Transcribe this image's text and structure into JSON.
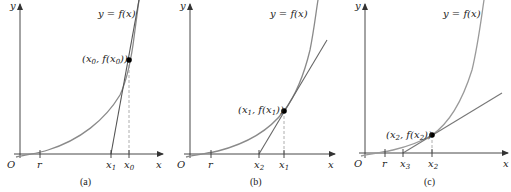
{
  "colors": {
    "axis": "#333333",
    "curve": "#8a8a8a",
    "tangent": "#6e6e6e",
    "point": "#000000",
    "dashed": "#9a9a9a"
  },
  "panels": [
    {
      "caption": "(a)",
      "curve_label": "y = f(x)",
      "point_label_var": "x",
      "point_label_sub": "0",
      "axis_labels": {
        "origin": "O",
        "y": "y",
        "x": "x"
      },
      "ticks": [
        {
          "var": "r",
          "sub": ""
        },
        {
          "var": "x",
          "sub": "1"
        },
        {
          "var": "x",
          "sub": "0"
        }
      ]
    },
    {
      "caption": "(b)",
      "curve_label": "y = f(x)",
      "point_label_var": "x",
      "point_label_sub": "1",
      "axis_labels": {
        "origin": "O",
        "y": "y",
        "x": "x"
      },
      "ticks": [
        {
          "var": "r",
          "sub": ""
        },
        {
          "var": "x",
          "sub": "2"
        },
        {
          "var": "x",
          "sub": "1"
        }
      ]
    },
    {
      "caption": "(c)",
      "curve_label": "y = f(x)",
      "point_label_var": "x",
      "point_label_sub": "2",
      "axis_labels": {
        "origin": "O",
        "y": "y",
        "x": "x"
      },
      "ticks": [
        {
          "var": "r",
          "sub": ""
        },
        {
          "var": "x",
          "sub": "3"
        },
        {
          "var": "x",
          "sub": "2"
        }
      ]
    }
  ],
  "text": {
    "pa_point": "(x0, f(x0))",
    "pb_point": "(x1, f(x1))",
    "pc_point": "(x2, f(x2))"
  }
}
